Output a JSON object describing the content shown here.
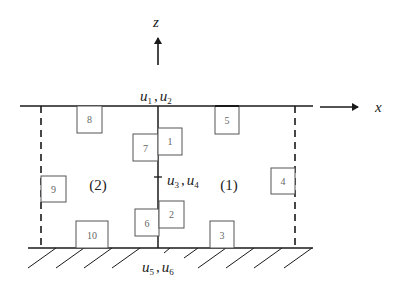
{
  "diagram": {
    "axes": {
      "x_label": "x",
      "z_label": "z"
    },
    "dof_labels": {
      "top": {
        "var1": "u",
        "sub1": "1",
        "sep": ",",
        "var2": "u",
        "sub2": "2"
      },
      "middle": {
        "var1": "u",
        "sub1": "3",
        "sep": ",",
        "var2": "u",
        "sub2": "4"
      },
      "bottom": {
        "var1": "u",
        "sub1": "5",
        "sep": ",",
        "var2": "u",
        "sub2": "6"
      }
    },
    "regions": {
      "left": "(2)",
      "right": "(1)"
    },
    "elements": [
      {
        "id": "1",
        "label": "1"
      },
      {
        "id": "2",
        "label": "2"
      },
      {
        "id": "3",
        "label": "3"
      },
      {
        "id": "4",
        "label": "4"
      },
      {
        "id": "5",
        "label": "5"
      },
      {
        "id": "6",
        "label": "6"
      },
      {
        "id": "7",
        "label": "7"
      },
      {
        "id": "8",
        "label": "8"
      },
      {
        "id": "9",
        "label": "9"
      },
      {
        "id": "10",
        "label": "10"
      }
    ],
    "colors": {
      "line": "#1a1a1a",
      "box_stroke": "#555555",
      "text": "#222222"
    }
  }
}
